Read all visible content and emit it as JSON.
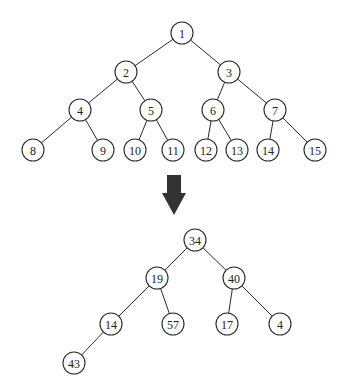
{
  "colors": {
    "background": "#ffffff",
    "stroke": "#2a2a2a",
    "text": "#222222",
    "arrow": "#333333"
  },
  "node_radius": 11,
  "trees": [
    {
      "name": "index-tree",
      "nodes": [
        {
          "id": "a1",
          "label": "1",
          "x": 182,
          "y": 33
        },
        {
          "id": "a2",
          "label": "2",
          "x": 126,
          "y": 72
        },
        {
          "id": "a3",
          "label": "3",
          "x": 229,
          "y": 72
        },
        {
          "id": "a4",
          "label": "4",
          "x": 80,
          "y": 110
        },
        {
          "id": "a5",
          "label": "5",
          "x": 151,
          "y": 110
        },
        {
          "id": "a6",
          "label": "6",
          "x": 213,
          "y": 110
        },
        {
          "id": "a7",
          "label": "7",
          "x": 275,
          "y": 110
        },
        {
          "id": "a8",
          "label": "8",
          "x": 33,
          "y": 150
        },
        {
          "id": "a9",
          "label": "9",
          "x": 103,
          "y": 150
        },
        {
          "id": "a10",
          "label": "10",
          "x": 135,
          "y": 150
        },
        {
          "id": "a11",
          "label": "11",
          "x": 173,
          "y": 150
        },
        {
          "id": "a12",
          "label": "12",
          "x": 206,
          "y": 150
        },
        {
          "id": "a13",
          "label": "13",
          "x": 237,
          "y": 150
        },
        {
          "id": "a14",
          "label": "14",
          "x": 268,
          "y": 150
        },
        {
          "id": "a15",
          "label": "15",
          "x": 315,
          "y": 150
        }
      ],
      "edges": [
        [
          "a1",
          "a2"
        ],
        [
          "a1",
          "a3"
        ],
        [
          "a2",
          "a4"
        ],
        [
          "a2",
          "a5"
        ],
        [
          "a3",
          "a6"
        ],
        [
          "a3",
          "a7"
        ],
        [
          "a4",
          "a8"
        ],
        [
          "a4",
          "a9"
        ],
        [
          "a5",
          "a10"
        ],
        [
          "a5",
          "a11"
        ],
        [
          "a6",
          "a12"
        ],
        [
          "a6",
          "a13"
        ],
        [
          "a7",
          "a14"
        ],
        [
          "a7",
          "a15"
        ]
      ]
    },
    {
      "name": "value-tree",
      "nodes": [
        {
          "id": "b1",
          "label": "34",
          "x": 195,
          "y": 240
        },
        {
          "id": "b2",
          "label": "19",
          "x": 157,
          "y": 278
        },
        {
          "id": "b3",
          "label": "40",
          "x": 234,
          "y": 278
        },
        {
          "id": "b4",
          "label": "14",
          "x": 111,
          "y": 324
        },
        {
          "id": "b5",
          "label": "57",
          "x": 173,
          "y": 324
        },
        {
          "id": "b6",
          "label": "17",
          "x": 227,
          "y": 324
        },
        {
          "id": "b7",
          "label": "4",
          "x": 280,
          "y": 324
        },
        {
          "id": "b8",
          "label": "43",
          "x": 74,
          "y": 363
        }
      ],
      "edges": [
        [
          "b1",
          "b2"
        ],
        [
          "b1",
          "b3"
        ],
        [
          "b2",
          "b4"
        ],
        [
          "b2",
          "b5"
        ],
        [
          "b3",
          "b6"
        ],
        [
          "b3",
          "b7"
        ],
        [
          "b4",
          "b8"
        ]
      ]
    }
  ],
  "arrow": {
    "icon": "down-arrow-icon",
    "points": "167,175 181,175 181,193 186,193 174,215 162,193 167,193"
  }
}
